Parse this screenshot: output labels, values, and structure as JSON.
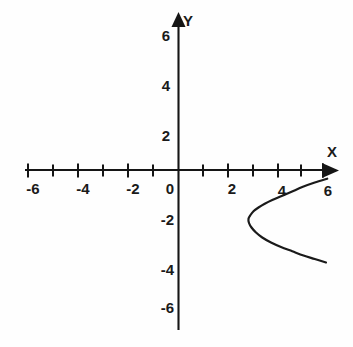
{
  "figure": {
    "background_color": "#fefefe",
    "ink_color": "#1a1a1a",
    "width": 353,
    "height": 347
  },
  "axes": {
    "x_axis_label": "X",
    "y_axis_label": "Y",
    "origin_label": "0"
  },
  "chart_data": {
    "type": "line",
    "title": "",
    "subtitle": "",
    "xlabel": "X",
    "ylabel": "Y",
    "xlim": [
      -6.2,
      6.2
    ],
    "ylim": [
      -6.5,
      6.5
    ],
    "grid": false,
    "legend": "none",
    "x_tick_labels": [
      "-6",
      "-4",
      "-2",
      "0",
      "2",
      "4",
      "6"
    ],
    "x_tick_values": [
      -6,
      -4,
      -2,
      0,
      2,
      4,
      6
    ],
    "x_minor_tick_values": [
      -6,
      -5,
      -4,
      -3,
      -2,
      -1,
      0,
      1,
      2,
      3,
      4,
      5,
      6
    ],
    "y_tick_labels": [
      "6",
      "4",
      "2",
      "0",
      "-2",
      "-4",
      "-6"
    ],
    "y_tick_values": [
      6,
      4,
      2,
      0,
      -2,
      -4,
      -6
    ],
    "annotations": [],
    "series": [
      {
        "name": "sideways parabola",
        "description": "Left-opening horizontal parabola with vertex at approximately (2.8, -1.95); upper branch rises to the right toward (5.95, -0.35) and lower branch descends to the right toward (5.9, -3.7).",
        "vertex": [
          2.8,
          -1.95
        ],
        "opens": "right",
        "points": [
          [
            5.95,
            -0.35
          ],
          [
            5.45,
            -0.5
          ],
          [
            4.95,
            -0.68
          ],
          [
            4.5,
            -0.88
          ],
          [
            4.1,
            -1.05
          ],
          [
            3.75,
            -1.2
          ],
          [
            3.45,
            -1.35
          ],
          [
            3.2,
            -1.5
          ],
          [
            3.0,
            -1.65
          ],
          [
            2.88,
            -1.8
          ],
          [
            2.8,
            -1.95
          ],
          [
            2.82,
            -2.12
          ],
          [
            2.92,
            -2.3
          ],
          [
            3.1,
            -2.5
          ],
          [
            3.35,
            -2.7
          ],
          [
            3.7,
            -2.9
          ],
          [
            4.1,
            -3.08
          ],
          [
            4.55,
            -3.25
          ],
          [
            5.0,
            -3.42
          ],
          [
            5.45,
            -3.56
          ],
          [
            5.9,
            -3.7
          ]
        ]
      }
    ]
  }
}
